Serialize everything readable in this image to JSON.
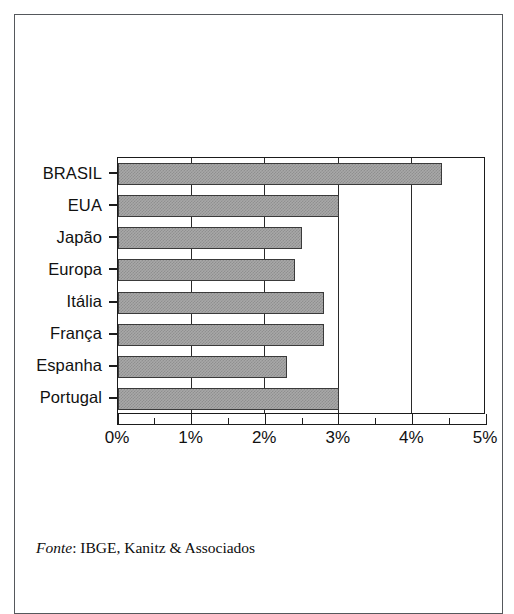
{
  "source_note": {
    "prefix": "Fonte",
    "text": ": IBGE, Kanitz & Associados"
  },
  "axis": {
    "ticks": [
      "0%",
      "1%",
      "2%",
      "3%",
      "4%",
      "5%"
    ]
  },
  "chart_data": {
    "type": "bar",
    "orientation": "horizontal",
    "title": "",
    "subtitle": "",
    "xlabel": "",
    "ylabel": "",
    "xlim": [
      0,
      5
    ],
    "xunit": "%",
    "xtick_step": 1,
    "xminor_step": 0.5,
    "grid": true,
    "grid_axis": "x",
    "legend": false,
    "bar_fill": "#a8a8a8",
    "bar_pattern": "checkerboard-dither",
    "bar_edge": "#3a3a3a",
    "categories": [
      "BRASIL",
      "EUA",
      "Japão",
      "Europa",
      "Itália",
      "França",
      "Espanha",
      "Portugal"
    ],
    "values": [
      4.4,
      3.0,
      2.5,
      2.4,
      2.8,
      2.8,
      2.3,
      3.0
    ],
    "value_labels": [
      "4,4%",
      "3,0%",
      "2,5%",
      "2,4%",
      "2,8%",
      "2,8%",
      "2,3%",
      "3,0%"
    ]
  }
}
